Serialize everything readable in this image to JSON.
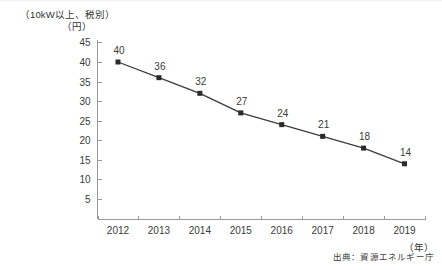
{
  "header": {
    "condition_label": "（10kW以上、税別）",
    "y_unit_label": "（円）"
  },
  "footer": {
    "source_text": "出典：資源エネルギー庁"
  },
  "chart_data": {
    "type": "line",
    "title": "",
    "subtitle": "",
    "xlabel": "（年）",
    "ylabel": "（円）",
    "annotation": "（10kW以上、税別）",
    "source": "出典：資源エネルギー庁",
    "categories": [
      "2012",
      "2013",
      "2014",
      "2015",
      "2016",
      "2017",
      "2018",
      "2019"
    ],
    "values": [
      40,
      36,
      32,
      27,
      24,
      21,
      18,
      14
    ],
    "point_labels": [
      "40",
      "36",
      "32",
      "27",
      "24",
      "21",
      "18",
      "14"
    ],
    "ylim": [
      0,
      45
    ],
    "yticks": [
      45,
      40,
      35,
      30,
      25,
      20,
      15,
      10,
      5
    ],
    "ytick_labels": [
      "45",
      "40",
      "35",
      "30",
      "25",
      "20",
      "15",
      "10",
      "5"
    ],
    "grid": false,
    "legend": null,
    "series": [
      {
        "name": "調達価格",
        "values": [
          40,
          36,
          32,
          27,
          24,
          21,
          18,
          14
        ],
        "color": "#3c3c3c",
        "marker": "square"
      }
    ]
  }
}
